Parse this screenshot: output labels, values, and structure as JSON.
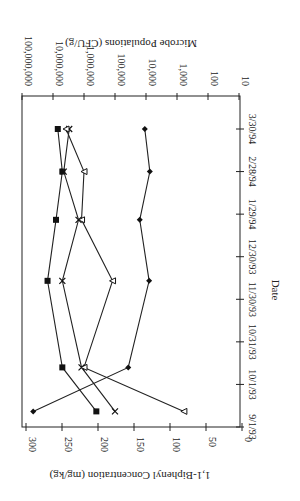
{
  "chart_data": {
    "type": "line",
    "orientation": "rotated 90 degrees counter-clockwise (date axis vertical on right side)",
    "title": "",
    "xlabel": "Date",
    "ylabel_left": "1,1-Biphenyl Concentration (mg/kg)",
    "ylabel_right": "Microbe Populations (CFU/g)",
    "x_ticks": [
      "9/1/93",
      "10/1/93",
      "10/31/93",
      "11/30/93",
      "12/30/93",
      "1/29/94",
      "2/28/94",
      "3/30/94"
    ],
    "y_left_ticks": [
      "0",
      "50",
      "100",
      "150",
      "200",
      "250",
      "300"
    ],
    "y_left_range": [
      0,
      300
    ],
    "y_right_ticks": [
      "10",
      "100",
      "1,000",
      "10,000",
      "100,000",
      "1,000,000",
      "10,000,000",
      "100,000,000"
    ],
    "y_right_range": [
      10,
      100000000
    ],
    "y_right_scale": "log",
    "grid": false,
    "legend": "none",
    "x": [
      "9/12/93",
      "10/13/93",
      "12/13/93",
      "1/25/94",
      "2/28/94",
      "3/30/94"
    ],
    "series": [
      {
        "name": "1,1-Biphenyl concentration",
        "marker": "diamond",
        "axis": "left",
        "values": [
          290,
          158,
          129,
          142,
          128,
          135
        ]
      },
      {
        "name": "Microbe population (square)",
        "marker": "square",
        "axis": "right",
        "values": [
          400000,
          5000000,
          15000000,
          8000000,
          5000000,
          7000000
        ]
      },
      {
        "name": "Microbe population (x)",
        "marker": "x",
        "axis": "right",
        "values": [
          100000,
          1200000,
          5000000,
          1500000,
          4500000,
          3000000
        ]
      },
      {
        "name": "Microbe population (triangle)",
        "marker": "triangle",
        "axis": "right",
        "values": [
          600,
          1000000,
          120000,
          1200000,
          1000000,
          3800000
        ]
      }
    ]
  }
}
